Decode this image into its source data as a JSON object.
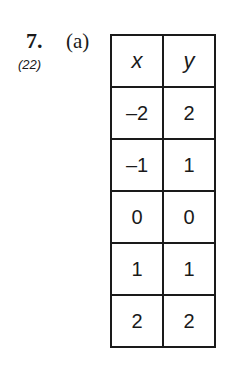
{
  "problem": {
    "number": "7.",
    "reference": "(22)",
    "part": "(a)"
  },
  "table": {
    "headers": [
      "x",
      "y"
    ],
    "rows": [
      [
        "–2",
        "2"
      ],
      [
        "–1",
        "1"
      ],
      [
        "0",
        "0"
      ],
      [
        "1",
        "1"
      ],
      [
        "2",
        "2"
      ]
    ]
  }
}
